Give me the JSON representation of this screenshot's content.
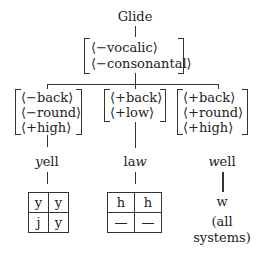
{
  "root": {
    "label": "Glide"
  },
  "root_features": [
    "⟨−vocalic⟩",
    "⟨−consonantal⟩"
  ],
  "branches": [
    {
      "features": [
        "⟨−back⟩",
        "⟨−round⟩",
        "⟨+high⟩"
      ],
      "word": {
        "italic": "y",
        "rest": "ell"
      },
      "grid": [
        [
          "y",
          "y"
        ],
        [
          "j",
          "y"
        ]
      ]
    },
    {
      "features": [
        "⟨+back⟩",
        "⟨+low⟩"
      ],
      "word": {
        "prefix": "la",
        "italic": "w"
      },
      "grid": [
        [
          "h",
          "h"
        ],
        [
          "—",
          "—"
        ]
      ]
    },
    {
      "features": [
        "⟨+back⟩",
        "⟨+round⟩",
        "⟨+high⟩"
      ],
      "word": {
        "italic": "w",
        "rest": "ell"
      },
      "result": "w",
      "note_line1": "(all",
      "note_line2": "systems)"
    }
  ]
}
